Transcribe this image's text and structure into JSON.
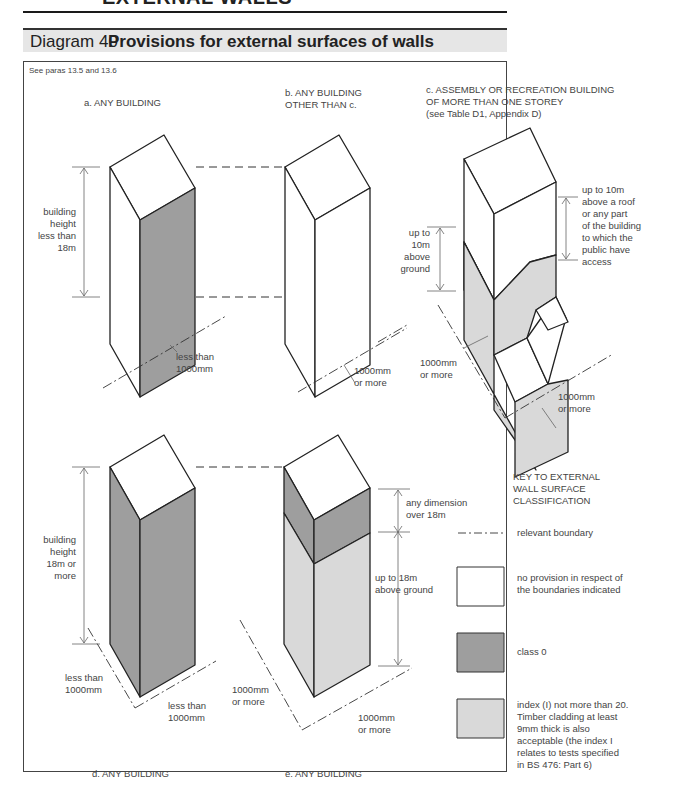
{
  "page_header": {
    "page_number": "84",
    "section_title": "EXTERNAL WALLS"
  },
  "diagram": {
    "number": "Diagram 40",
    "title": "Provisions for external surfaces of walls",
    "see_paras": "See paras 13.5 and 13.6",
    "colors": {
      "class0": "#9e9e9e",
      "index_i": "#d9d9d9",
      "no_provision": "#ffffff",
      "title_bar_bg": "#e6e6e6",
      "line": "#222222"
    },
    "panels": {
      "a": {
        "caption": "a. ANY BUILDING",
        "height_label": [
          "building",
          "height",
          "less than",
          "18m"
        ],
        "distance_label": [
          "less than",
          "1000mm"
        ]
      },
      "b": {
        "caption": [
          "b. ANY BUILDING",
          "OTHER THAN c."
        ],
        "distance_label": [
          "1000mm",
          "or more"
        ]
      },
      "c": {
        "caption": [
          "c. ASSEMBLY OR RECREATION BUILDING",
          "OF MORE THAN ONE STOREY",
          "(see Table D1, Appendix D)"
        ],
        "left_height_label": [
          "up to",
          "10m",
          "above",
          "ground"
        ],
        "right_height_label": [
          "up to 10m",
          "above a roof",
          "or any part",
          "of the building",
          "to which the",
          "public have",
          "access"
        ],
        "distance_left": [
          "1000mm",
          "or more"
        ],
        "distance_right": [
          "1000mm",
          "or more"
        ]
      },
      "d": {
        "caption": "d. ANY BUILDING",
        "height_label": [
          "building",
          "height",
          "18m or",
          "more"
        ],
        "distance_left": [
          "less than",
          "1000mm"
        ],
        "distance_right": [
          "less than",
          "1000mm"
        ]
      },
      "e": {
        "caption": "e. ANY BUILDING",
        "upper_label": [
          "any dimension",
          "over 18m"
        ],
        "lower_label": [
          "up to 18m",
          "above ground"
        ],
        "distance_left": [
          "1000mm",
          "or more"
        ],
        "distance_right": [
          "1000mm",
          "or more"
        ]
      }
    },
    "key": {
      "title": [
        "KEY TO EXTERNAL",
        "WALL SURFACE",
        "CLASSIFICATION"
      ],
      "items": [
        {
          "symbol": "dash-dot-line",
          "label": [
            "relevant boundary"
          ]
        },
        {
          "symbol": "white-box",
          "label": [
            "no provision in respect of",
            "the boundaries indicated"
          ]
        },
        {
          "symbol": "dark-grey-box",
          "label": [
            "class 0"
          ]
        },
        {
          "symbol": "light-grey-box",
          "label": [
            "index (I) not more than 20.",
            "Timber cladding at least",
            "9mm thick is also",
            "acceptable (the index I",
            "relates to tests specified",
            "in BS 476: Part 6)"
          ]
        }
      ]
    }
  }
}
